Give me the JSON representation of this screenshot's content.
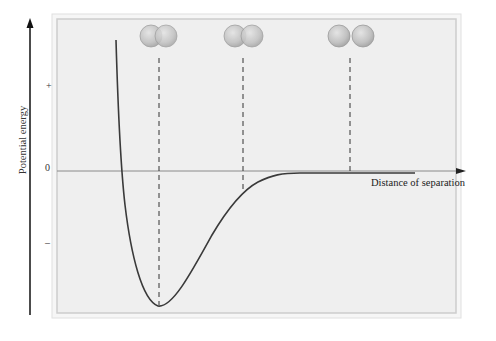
{
  "diagram": {
    "type": "potential-energy-curve",
    "y_axis": {
      "title": "Potential energy",
      "labels": {
        "plus": "+",
        "zero": "0",
        "minus": "–"
      }
    },
    "x_axis": {
      "title": "Distance of separation"
    },
    "molecules": [
      {
        "name": "overlapping-atoms",
        "description": "Atoms overlapping too closely (repulsion)"
      },
      {
        "name": "bonded-atoms",
        "description": "Atoms at optimal bond distance"
      },
      {
        "name": "separated-atoms",
        "description": "Atoms far apart, no interaction"
      }
    ],
    "colors": {
      "panel_bg": "#efefef",
      "frame": "#cfcfcf",
      "curve": "#3a3a3a",
      "axis": "#8a8a8a",
      "atom_fill": "#c4c4c4",
      "atom_stroke": "#9a9a9a"
    }
  }
}
